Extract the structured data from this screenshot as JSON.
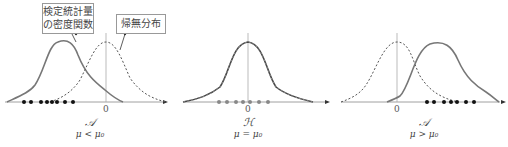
{
  "callouts": {
    "test_statistic_density": {
      "line1": "検定統計量",
      "line2": "の密度関数"
    },
    "null_distribution": "帰無分布"
  },
  "panels": [
    {
      "id": "left",
      "zero_label": "0",
      "hypothesis": "𝒜",
      "condition": "μ < μ₀"
    },
    {
      "id": "center",
      "zero_label": "0",
      "hypothesis": "ℋ",
      "condition": "μ = μ₀"
    },
    {
      "id": "right",
      "zero_label": "0",
      "hypothesis": "𝒜",
      "condition": "μ > μ₀"
    }
  ],
  "colors": {
    "curve": "#777777",
    "axis": "#888888",
    "dots_black": "#111111",
    "dots_gray": "#888888",
    "border": "#999999"
  }
}
